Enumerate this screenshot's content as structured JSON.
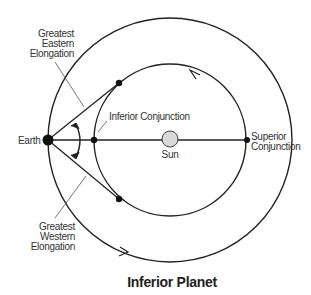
{
  "diagram": {
    "title": "Inferior Planet",
    "labels": {
      "earth": "Earth",
      "sun": "Sun",
      "inferior_conjunction": "Inferior Conjunction",
      "superior_conjunction_1": "Superior",
      "superior_conjunction_2": "Conjunction",
      "eastern_1": "Greatest",
      "eastern_2": "Eastern",
      "eastern_3": "Elongation",
      "western_1": "Greatest",
      "western_2": "Western",
      "western_3": "Elongation"
    },
    "colors": {
      "line": "#222222",
      "sun_fill": "#d9d9d9",
      "text": "#333333"
    }
  }
}
